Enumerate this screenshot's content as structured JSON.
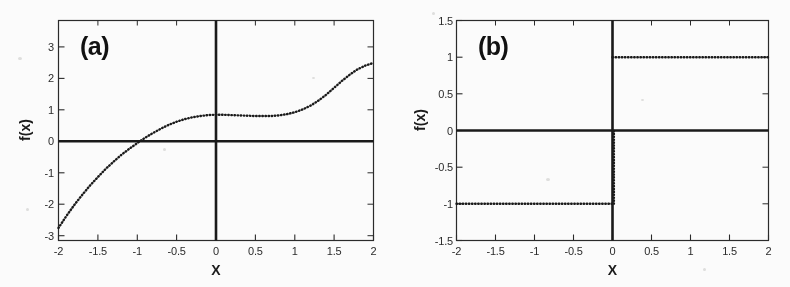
{
  "figure": {
    "background_color": "#fbfbfa",
    "ink_color": "#1c1c1c",
    "width": 790,
    "height": 287
  },
  "panels": [
    {
      "id": "a",
      "label": "(a)",
      "xlabel": "X",
      "ylabel": "f(x)",
      "xlim": [
        -2,
        2
      ],
      "ylim": [
        -3.5,
        3.5
      ],
      "xticks": [
        "-2",
        "-1.5",
        "-1",
        "-0.5",
        "0",
        "0.5",
        "1",
        "1.5",
        "2"
      ],
      "xtick_values": [
        -2,
        -1.5,
        -1,
        -0.5,
        0,
        0.5,
        1,
        1.5,
        2
      ],
      "yticks": [
        "3",
        "2",
        "1",
        "0",
        "-1",
        "-2",
        "-3"
      ],
      "ytick_values": [
        3,
        2,
        1,
        0,
        -1,
        -2,
        -3
      ]
    },
    {
      "id": "b",
      "label": "(b)",
      "xlabel": "X",
      "ylabel": "f(x)",
      "xlim": [
        -2,
        2
      ],
      "ylim": [
        -1.5,
        1.5
      ],
      "xticks": [
        "-2",
        "-1.5",
        "-1",
        "-0.5",
        "0",
        "0.5",
        "1",
        "1.5",
        "2"
      ],
      "xtick_values": [
        -2,
        -1.5,
        -1,
        -0.5,
        0,
        0.5,
        1,
        1.5,
        2
      ],
      "yticks": [
        "1.5",
        "1",
        "0.5",
        "0",
        "-0.5",
        "-1",
        "-1.5"
      ],
      "ytick_values": [
        1.5,
        1,
        0.5,
        0,
        -0.5,
        -1,
        -1.5
      ]
    }
  ],
  "chart_data": [
    {
      "type": "scatter",
      "panel": "a",
      "title": "(a)",
      "xlabel": "X",
      "ylabel": "f(x)",
      "xlim": [
        -2,
        2
      ],
      "ylim": [
        -3.5,
        3.5
      ],
      "grid": false,
      "legend": "none",
      "marker": "dotted-small",
      "series": [
        {
          "name": "f(x)",
          "x": [
            -2.0,
            -1.9,
            -1.8,
            -1.7,
            -1.6,
            -1.5,
            -1.4,
            -1.3,
            -1.2,
            -1.1,
            -1.0,
            -0.9,
            -0.8,
            -0.7,
            -0.6,
            -0.5,
            -0.4,
            -0.3,
            -0.2,
            -0.1,
            0.0,
            0.1,
            0.2,
            0.3,
            0.4,
            0.5,
            0.6,
            0.7,
            0.8,
            0.9,
            1.0,
            1.1,
            1.2,
            1.3,
            1.4,
            1.5,
            1.6,
            1.7,
            1.8,
            1.9,
            2.0
          ],
          "y": [
            -3.1,
            -2.72,
            -2.37,
            -2.05,
            -1.75,
            -1.48,
            -1.22,
            -0.99,
            -0.77,
            -0.58,
            -0.4,
            -0.23,
            -0.08,
            0.06,
            0.18,
            0.28,
            0.36,
            0.42,
            0.46,
            0.49,
            0.5,
            0.5,
            0.49,
            0.48,
            0.47,
            0.46,
            0.46,
            0.46,
            0.48,
            0.52,
            0.58,
            0.67,
            0.79,
            0.95,
            1.14,
            1.36,
            1.58,
            1.78,
            1.95,
            2.07,
            2.15
          ]
        }
      ],
      "annotations": [
        "monotonically increasing dotted curve",
        "zero crossing near x = -0.85",
        "plateau near f(x) = 0.5 for -0.1 < x < 0.7"
      ]
    },
    {
      "type": "scatter",
      "panel": "b",
      "title": "(b)",
      "xlabel": "X",
      "ylabel": "f(x)",
      "xlim": [
        -2,
        2
      ],
      "ylim": [
        -1.5,
        1.5
      ],
      "grid": false,
      "legend": "none",
      "marker": "dotted-small",
      "series": [
        {
          "name": "f(x) = -1 for x < 0",
          "x": [
            -2.0,
            -1.8,
            -1.6,
            -1.4,
            -1.2,
            -1.0,
            -0.8,
            -0.6,
            -0.4,
            -0.2,
            0.0
          ],
          "y": [
            -1.0,
            -1.0,
            -1.0,
            -1.0,
            -1.0,
            -1.0,
            -1.0,
            -1.0,
            -1.0,
            -1.0,
            -1.0
          ]
        },
        {
          "name": "f(x) = +1 for x > 0",
          "x": [
            0.0,
            0.2,
            0.4,
            0.6,
            0.8,
            1.0,
            1.2,
            1.4,
            1.6,
            1.8,
            2.0
          ],
          "y": [
            1.0,
            1.0,
            1.0,
            1.0,
            1.0,
            1.0,
            1.0,
            1.0,
            1.0,
            1.0,
            1.0
          ]
        },
        {
          "name": "vertical transition at x = 0",
          "x": [
            0.0,
            0.0
          ],
          "y": [
            -1.0,
            1.0
          ]
        }
      ],
      "annotations": [
        "step / sign function",
        "value -1 on x in [-2, 0)",
        "value +1 on x in (0, 2]",
        "discontinuity at x = 0 drawn as dotted vertical segment"
      ]
    }
  ]
}
